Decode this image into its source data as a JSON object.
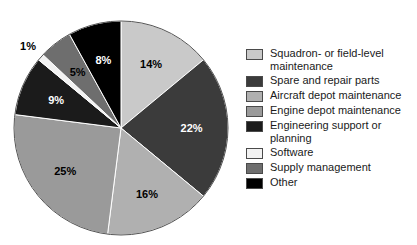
{
  "chart_data": {
    "type": "pie",
    "title": "",
    "subtitle": "",
    "xlabel": "",
    "ylabel": "",
    "legend_position": "right",
    "grid": false,
    "units": "percent",
    "start_angle_deg": 0,
    "direction": "clockwise",
    "categories": [
      "Squadron- or field-level maintenance",
      "Spare and repair parts",
      "Aircraft depot maintenance",
      "Engine depot maintenance",
      "Engineering support or planning",
      "Software",
      "Supply management",
      "Other"
    ],
    "values": [
      14,
      22,
      16,
      25,
      9,
      1,
      5,
      8
    ],
    "labels": [
      "14%",
      "22%",
      "16%",
      "25%",
      "9%",
      "1%",
      "5%",
      "8%"
    ],
    "colors": [
      "#c9c9c9",
      "#3b3b3b",
      "#b0b0b0",
      "#9a9a9a",
      "#1b1b1b",
      "#f2f2f2",
      "#6e6e6e",
      "#000000"
    ],
    "label_colors": [
      "#000000",
      "#ffffff",
      "#000000",
      "#000000",
      "#ffffff",
      "#000000",
      "#000000",
      "#ffffff"
    ],
    "label_outside": [
      false,
      false,
      false,
      false,
      false,
      true,
      false,
      false
    ]
  },
  "legend": {
    "items": [
      {
        "label": "Squadron- or field-level\nmaintenance",
        "color": "#c9c9c9"
      },
      {
        "label": "Spare and repair parts",
        "color": "#3b3b3b"
      },
      {
        "label": "Aircraft depot maintenance",
        "color": "#b0b0b0"
      },
      {
        "label": "Engine depot maintenance",
        "color": "#9a9a9a"
      },
      {
        "label": "Engineering support or\nplanning",
        "color": "#1b1b1b"
      },
      {
        "label": "Software",
        "color": "#f2f2f2"
      },
      {
        "label": "Supply management",
        "color": "#6e6e6e"
      },
      {
        "label": "Other",
        "color": "#000000"
      }
    ]
  },
  "pie_geometry": {
    "cx": 121,
    "cy": 128,
    "r": 107
  }
}
